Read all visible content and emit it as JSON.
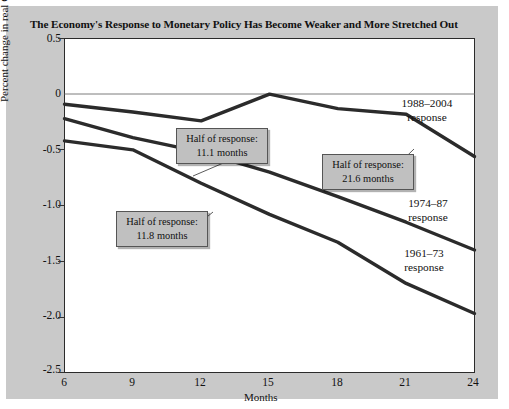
{
  "figure": {
    "title": "The Economy's Response to Monetary Policy Has Become Weaker and More Stretched Out",
    "panel_color": "#c9c9c9",
    "plot_color": "#ffffff",
    "line_color": "#2b2b2b",
    "annotation_fill": "#c0c0c0"
  },
  "chart_data": {
    "type": "line",
    "title": "The Economy's Response to Monetary Policy Has Become Weaker and More Stretched Out",
    "xlabel": "Months",
    "ylabel": "Percent change in real GDP",
    "x": [
      6,
      9,
      12,
      15,
      18,
      21,
      24
    ],
    "xlim": [
      6,
      24
    ],
    "ylim": [
      -2.5,
      0.5
    ],
    "xticks": [
      "6",
      "9",
      "12",
      "15",
      "18",
      "21",
      "24"
    ],
    "yticks": [
      "0.5",
      "0",
      "-0.5",
      "-1.0",
      "-1.5",
      "-2.0",
      "-2.5"
    ],
    "grid": false,
    "legend_position": "inline-right-labels",
    "series": [
      {
        "name": "1988-2004 response",
        "label": "1988–2004",
        "label_line2": "response",
        "values": [
          -0.09,
          -0.16,
          -0.24,
          0.0,
          -0.13,
          -0.18,
          -0.56
        ],
        "half_of_response_months": "21.6"
      },
      {
        "name": "1974-87 response",
        "label": "1974–87",
        "label_line2": "response",
        "values": [
          -0.22,
          -0.39,
          -0.52,
          -0.7,
          -0.92,
          -1.15,
          -1.4
        ],
        "half_of_response_months": "11.1"
      },
      {
        "name": "1961-73 response",
        "label": "1961–73",
        "label_line2": "response",
        "values": [
          -0.42,
          -0.5,
          -0.8,
          -1.08,
          -1.33,
          -1.7,
          -1.97
        ],
        "half_of_response_months": "11.8"
      }
    ],
    "annotations": [
      {
        "line1": "Half of response:",
        "line2": "11.1  months",
        "series": "1974-87 response"
      },
      {
        "line1": "Half of response:",
        "line2": "21.6 months",
        "series": "1988-2004 response"
      },
      {
        "line1": "Half of response:",
        "line2": "11.8 months",
        "series": "1961-73 response"
      }
    ]
  },
  "axis": {
    "x_label": "Months",
    "y_label": "Percent change in real GDP",
    "x_ticks": [
      "6",
      "9",
      "12",
      "15",
      "18",
      "21",
      "24"
    ],
    "y_ticks": [
      "0.5",
      "0",
      "-0.5",
      "-1.0",
      "-1.5",
      "-2.0",
      "-2.5"
    ]
  },
  "series_labels": [
    {
      "line1": "1988–2004",
      "line2": "response"
    },
    {
      "line1": "1974–87",
      "line2": "response"
    },
    {
      "line1": "1961–73",
      "line2": "response"
    }
  ],
  "annotations": [
    {
      "line1": "Half of response:",
      "line2": "11.1  months"
    },
    {
      "line1": "Half of response:",
      "line2": "21.6 months"
    },
    {
      "line1": "Half of response:",
      "line2": "11.8 months"
    }
  ]
}
